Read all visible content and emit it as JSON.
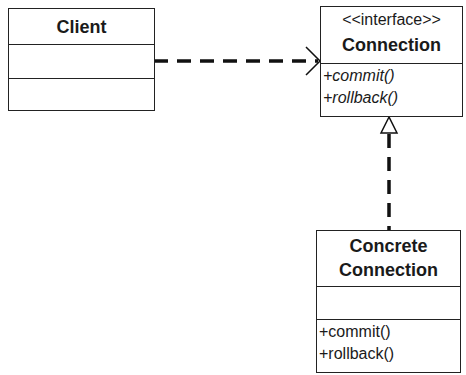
{
  "classes": {
    "client": {
      "name": "Client"
    },
    "connection": {
      "stereotype": "<<interface>>",
      "name": "Connection",
      "operations": [
        "+commit()",
        "+rollback()"
      ]
    },
    "concrete": {
      "name_line1": "Concrete",
      "name_line2": "Connection",
      "operations": [
        "+commit()",
        "+rollback()"
      ]
    }
  },
  "relations": [
    {
      "type": "dependency",
      "from": "Client",
      "to": "Connection"
    },
    {
      "type": "realization",
      "from": "Concrete Connection",
      "to": "Connection"
    }
  ]
}
